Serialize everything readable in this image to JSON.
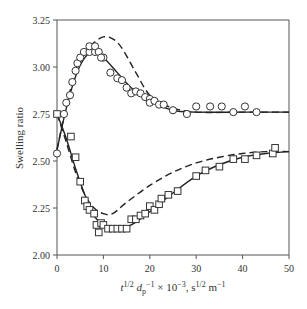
{
  "chart_data": {
    "type": "scatter",
    "title": "",
    "xlabel": "t^{1/2} d_p^{-1} × 10^{-3}, s^{1/2} m^{-1}",
    "xlabel_parts": {
      "t": "t",
      "t_sup": "1/2",
      "d": "d",
      "d_sub": "p",
      "d_sup": "−1",
      "rest": " × 10",
      "rest_sup": "−3",
      "unit": ", s",
      "unit_sup": "1/2",
      "unit2": " m",
      "unit2_sup": "−1"
    },
    "ylabel": "Swelling ratio",
    "xlim": [
      0,
      50
    ],
    "ylim": [
      2.0,
      3.25
    ],
    "xticks": [
      "0",
      "10",
      "20",
      "30",
      "40",
      "50"
    ],
    "yticks": [
      "2.00",
      "2.25",
      "2.50",
      "2.75",
      "3.00",
      "3.25"
    ],
    "grid": false,
    "legend": "none",
    "series": [
      {
        "name": "circles (upper) data",
        "marker": "circle",
        "points": [
          [
            0,
            2.54
          ],
          [
            1.5,
            2.75
          ],
          [
            2,
            2.81
          ],
          [
            2.8,
            2.85
          ],
          [
            3.3,
            2.92
          ],
          [
            4,
            2.98
          ],
          [
            4.4,
            3.02
          ],
          [
            5,
            3.05
          ],
          [
            5.8,
            3.08
          ],
          [
            7,
            3.08
          ],
          [
            7,
            3.11
          ],
          [
            8.2,
            3.08
          ],
          [
            8.2,
            3.11
          ],
          [
            9,
            3.08
          ],
          [
            10,
            3.05
          ],
          [
            9.5,
            3.05
          ],
          [
            11.5,
            2.97
          ],
          [
            13,
            2.94
          ],
          [
            14,
            2.93
          ],
          [
            15,
            2.89
          ],
          [
            16,
            2.86
          ],
          [
            17,
            2.87
          ],
          [
            18,
            2.86
          ],
          [
            19,
            2.84
          ],
          [
            20,
            2.83
          ],
          [
            20,
            2.81
          ],
          [
            21,
            2.82
          ],
          [
            22,
            2.8
          ],
          [
            23,
            2.8
          ],
          [
            25,
            2.77
          ],
          [
            28,
            2.75
          ],
          [
            30,
            2.79
          ],
          [
            33,
            2.79
          ],
          [
            35.5,
            2.79
          ],
          [
            38,
            2.76
          ],
          [
            40.5,
            2.79
          ],
          [
            43,
            2.76
          ]
        ]
      },
      {
        "name": "circles model (solid)",
        "line": "solid",
        "points": [
          [
            0,
            2.56
          ],
          [
            2,
            2.78
          ],
          [
            4,
            2.95
          ],
          [
            6,
            3.05
          ],
          [
            8,
            3.08
          ],
          [
            10,
            3.05
          ],
          [
            13,
            2.97
          ],
          [
            16,
            2.89
          ],
          [
            20,
            2.82
          ],
          [
            25,
            2.77
          ],
          [
            30,
            2.76
          ],
          [
            40,
            2.76
          ],
          [
            50,
            2.76
          ]
        ]
      },
      {
        "name": "circles model (dashed)",
        "line": "dashed",
        "points": [
          [
            0,
            2.56
          ],
          [
            2,
            2.79
          ],
          [
            4,
            2.98
          ],
          [
            6,
            3.08
          ],
          [
            8,
            3.13
          ],
          [
            10,
            3.16
          ],
          [
            12,
            3.15
          ],
          [
            14,
            3.1
          ],
          [
            17,
            2.97
          ],
          [
            20,
            2.85
          ],
          [
            24,
            2.79
          ],
          [
            30,
            2.76
          ],
          [
            40,
            2.76
          ],
          [
            50,
            2.76
          ]
        ]
      },
      {
        "name": "squares (lower) data",
        "marker": "square",
        "points": [
          [
            0,
            2.75
          ],
          [
            3,
            2.63
          ],
          [
            4,
            2.52
          ],
          [
            5,
            2.39
          ],
          [
            6,
            2.29
          ],
          [
            6.5,
            2.26
          ],
          [
            7,
            2.24
          ],
          [
            8,
            2.22
          ],
          [
            8.5,
            2.16
          ],
          [
            9,
            2.12
          ],
          [
            9.5,
            2.17
          ],
          [
            10,
            2.16
          ],
          [
            11,
            2.14
          ],
          [
            12,
            2.14
          ],
          [
            13,
            2.14
          ],
          [
            14,
            2.14
          ],
          [
            15,
            2.14
          ],
          [
            16,
            2.19
          ],
          [
            17,
            2.19
          ],
          [
            18,
            2.21
          ],
          [
            19,
            2.22
          ],
          [
            20,
            2.26
          ],
          [
            21,
            2.24
          ],
          [
            22,
            2.27
          ],
          [
            22.5,
            2.3
          ],
          [
            24,
            2.32
          ],
          [
            26,
            2.34
          ],
          [
            30,
            2.42
          ],
          [
            32,
            2.45
          ],
          [
            35,
            2.47
          ],
          [
            38,
            2.51
          ],
          [
            40.5,
            2.51
          ],
          [
            43,
            2.53
          ],
          [
            46.5,
            2.54
          ],
          [
            47,
            2.57
          ]
        ]
      },
      {
        "name": "squares model (solid)",
        "line": "solid",
        "points": [
          [
            0,
            2.75
          ],
          [
            2,
            2.62
          ],
          [
            4,
            2.46
          ],
          [
            6,
            2.32
          ],
          [
            8,
            2.21
          ],
          [
            10,
            2.16
          ],
          [
            13,
            2.14
          ],
          [
            16,
            2.16
          ],
          [
            20,
            2.23
          ],
          [
            25,
            2.33
          ],
          [
            30,
            2.42
          ],
          [
            35,
            2.48
          ],
          [
            40,
            2.52
          ],
          [
            45,
            2.54
          ],
          [
            50,
            2.55
          ]
        ]
      },
      {
        "name": "squares model (dashed)",
        "line": "dashed",
        "points": [
          [
            0,
            2.75
          ],
          [
            2,
            2.6
          ],
          [
            4,
            2.44
          ],
          [
            6,
            2.32
          ],
          [
            8,
            2.25
          ],
          [
            10,
            2.22
          ],
          [
            12,
            2.22
          ],
          [
            15,
            2.28
          ],
          [
            20,
            2.37
          ],
          [
            25,
            2.44
          ],
          [
            30,
            2.49
          ],
          [
            35,
            2.52
          ],
          [
            40,
            2.54
          ],
          [
            45,
            2.55
          ],
          [
            50,
            2.55
          ]
        ]
      }
    ]
  }
}
